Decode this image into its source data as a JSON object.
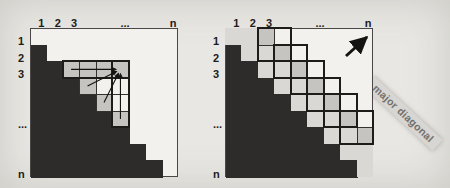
{
  "figure": {
    "background": "#e8e7e3",
    "paper_white": "#f2f1ed",
    "black_fill": "#2d2c2a",
    "light_gray": "#d9d8d4",
    "medium_gray": "#c5c4c0"
  },
  "note": {
    "text": "major diagonal"
  },
  "panels": [
    {
      "name": "left-matrix-panel",
      "grid": {
        "x": 30,
        "y": 28,
        "w": 148,
        "h": 149,
        "rows": 9,
        "cols": 9
      },
      "top_labels": [
        {
          "text": "1",
          "col": 1
        },
        {
          "text": "2",
          "col": 2
        },
        {
          "text": "3",
          "col": 3
        },
        {
          "text": "...",
          "col": 6
        },
        {
          "text": "n",
          "col": 9
        }
      ],
      "side_labels": [
        {
          "text": "1",
          "row": 1
        },
        {
          "text": "2",
          "row": 2
        },
        {
          "text": "3",
          "row": 3
        },
        {
          "text": "...",
          "row": 6
        },
        {
          "text": "n",
          "row": 9
        }
      ],
      "black_cols_per_row": [
        0,
        1,
        2,
        3,
        4,
        5,
        6,
        7,
        8
      ],
      "light_cells": [],
      "medium_cells": [
        [
          3,
          3
        ],
        [
          3,
          4
        ],
        [
          3,
          5
        ],
        [
          3,
          6
        ],
        [
          4,
          4
        ],
        [
          5,
          5
        ],
        [
          6,
          6
        ]
      ],
      "boxes": [
        {
          "r1": 3,
          "c1": 3,
          "r2": 3,
          "c2": 6
        },
        {
          "r1": 3,
          "c1": 6,
          "r2": 6,
          "c2": 6
        }
      ],
      "arrows": [
        {
          "from": [
            3,
            3
          ],
          "to": [
            3,
            6
          ]
        },
        {
          "from": [
            4,
            4
          ],
          "to": [
            3,
            6
          ]
        },
        {
          "from": [
            5,
            5
          ],
          "to": [
            3,
            6
          ]
        },
        {
          "from": [
            6,
            6
          ],
          "to": [
            3,
            6
          ]
        }
      ],
      "unused_label": {
        "text": "unused",
        "cx": 77,
        "cy": 134
      }
    },
    {
      "name": "right-matrix-panel",
      "grid": {
        "x": 225,
        "y": 28,
        "w": 148,
        "h": 149,
        "rows": 9,
        "cols": 9
      },
      "top_labels": [
        {
          "text": "1",
          "col": 1
        },
        {
          "text": "2",
          "col": 2
        },
        {
          "text": "3",
          "col": 3
        },
        {
          "text": "...",
          "col": 6
        },
        {
          "text": "n",
          "col": 9
        }
      ],
      "side_labels": [
        {
          "text": "1",
          "row": 1
        },
        {
          "text": "2",
          "row": 2
        },
        {
          "text": "3",
          "row": 3
        },
        {
          "text": "...",
          "row": 6
        },
        {
          "text": "n",
          "row": 9
        }
      ],
      "black_cols_per_row": [
        0,
        1,
        2,
        3,
        4,
        5,
        6,
        7,
        8
      ],
      "light_cells": [
        [
          1,
          1
        ],
        [
          2,
          2
        ],
        [
          3,
          3
        ],
        [
          4,
          4
        ],
        [
          5,
          5
        ],
        [
          6,
          6
        ],
        [
          7,
          7
        ],
        [
          8,
          8
        ],
        [
          9,
          9
        ],
        [
          1,
          2
        ],
        [
          2,
          3
        ],
        [
          3,
          4
        ],
        [
          4,
          5
        ],
        [
          5,
          6
        ],
        [
          6,
          7
        ],
        [
          7,
          8
        ],
        [
          8,
          9
        ]
      ],
      "medium_cells": [
        [
          1,
          3
        ],
        [
          2,
          4
        ],
        [
          3,
          5
        ],
        [
          4,
          6
        ],
        [
          5,
          7
        ],
        [
          6,
          8
        ],
        [
          7,
          9
        ]
      ],
      "boxes": [
        {
          "r1": 1,
          "c1": 3,
          "r2": 2,
          "c2": 4
        },
        {
          "r1": 2,
          "c1": 4,
          "r2": 3,
          "c2": 5
        },
        {
          "r1": 3,
          "c1": 5,
          "r2": 4,
          "c2": 6
        },
        {
          "r1": 4,
          "c1": 6,
          "r2": 5,
          "c2": 7
        },
        {
          "r1": 5,
          "c1": 7,
          "r2": 6,
          "c2": 8
        },
        {
          "r1": 6,
          "c1": 8,
          "r2": 7,
          "c2": 9
        }
      ],
      "arrows": [],
      "direction_arrow": {
        "x1": 346,
        "y1": 56,
        "x2": 367,
        "y2": 37
      },
      "unused_label": {
        "text": "unused",
        "cx": 280,
        "cy": 134
      }
    }
  ]
}
